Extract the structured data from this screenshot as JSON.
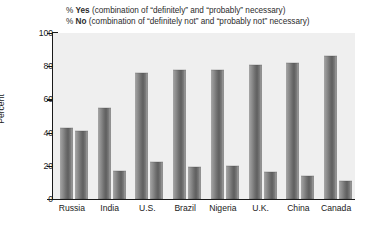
{
  "chart_data": {
    "type": "bar",
    "title": "",
    "xlabel": "",
    "ylabel": "Percent",
    "ylim": [
      0,
      100
    ],
    "yticks": [
      0,
      20,
      40,
      60,
      80,
      100
    ],
    "grid": false,
    "legend_position": "top",
    "categories": [
      "Russia",
      "India",
      "U.S.",
      "Brazil",
      "Nigeria",
      "U.K.",
      "China",
      "Canada"
    ],
    "series": [
      {
        "name": "% Yes (combination of “definitely” and “probably” necessary)",
        "short_name": "% Yes",
        "values": [
          43,
          55,
          76,
          78,
          78,
          81,
          82,
          86
        ]
      },
      {
        "name": "% No (combination of “definitely not” and “probably not” necessary)",
        "short_name": "% No",
        "values": [
          41,
          17,
          22,
          19,
          20,
          16,
          14,
          11
        ]
      }
    ],
    "annotations": []
  },
  "legend": {
    "line1_pct": "% ",
    "line1_key": "Yes",
    "line1_rest": " (combination of “definitely” and “probably” necessary)",
    "line2_pct": "% ",
    "line2_key": "No",
    "line2_rest": " (combination of “definitely not” and “probably not” necessary)"
  },
  "axis": {
    "y_title": "Percent",
    "y_tick_0": "0",
    "y_tick_1": "20",
    "y_tick_2": "40",
    "y_tick_3": "60",
    "y_tick_4": "80",
    "y_tick_5": "100"
  },
  "colors": {
    "plot_background": "#efefef",
    "axis": "#1a1a1a",
    "bar_mid": "#6e6e6e",
    "bar_light": "#b9b9b9",
    "page_background": "#ffffff"
  }
}
